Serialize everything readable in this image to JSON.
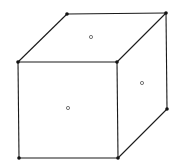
{
  "diagram": {
    "type": "cube-wireframe",
    "background": "#ffffff",
    "edge_color": "#1a1a1a",
    "vertex_color": "#111111",
    "face_marker_color": "#555555",
    "vertices": {
      "front_top_left": [
        18,
        62
      ],
      "front_top_right": [
        117,
        62
      ],
      "front_bottom_left": [
        19,
        158
      ],
      "front_bottom_right": [
        118,
        158
      ],
      "back_top_left": [
        67,
        14
      ],
      "back_top_right": [
        166,
        13
      ],
      "back_bottom_right": [
        167,
        109
      ]
    },
    "face_markers": {
      "top": [
        91,
        37
      ],
      "right": [
        142,
        83
      ],
      "front": [
        68,
        108
      ]
    }
  }
}
